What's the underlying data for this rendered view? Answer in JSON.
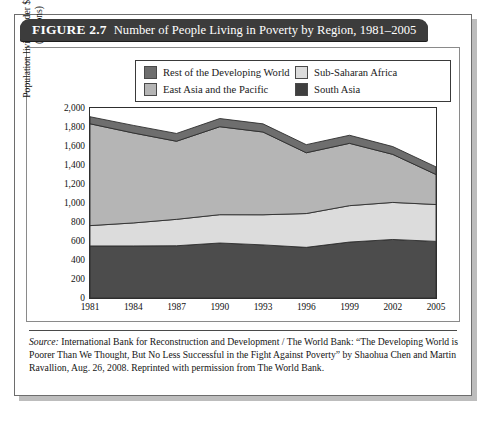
{
  "figure": {
    "number": "FIGURE 2.7",
    "title": "Number of People Living in Poverty by Region, 1981–2005"
  },
  "source": {
    "label": "Source:",
    "text": " International Bank for Reconstruction and Development / The World Bank: “The Developing World is Poorer Than We Thought, But No Less Successful in the Fight Against Poverty” by Shaohua Chen and Martin Ravallion, Aug. 26, 2008.  Reprinted with permission from The World Bank."
  },
  "chart_data": {
    "type": "area",
    "stacked": true,
    "title": "Number of People Living in Poverty by Region, 1981–2005",
    "xlabel": "",
    "ylabel": "Population living under $1.25 per day (millions)",
    "ylabel_line1": "Population living under $1.25 per day",
    "ylabel_line2": "(millions)",
    "categories": [
      "1981",
      "1984",
      "1987",
      "1990",
      "1993",
      "1996",
      "1999",
      "2002",
      "2005"
    ],
    "x": [
      1981,
      1984,
      1987,
      1990,
      1993,
      1996,
      1999,
      2002,
      2005
    ],
    "ylim": [
      0,
      2000
    ],
    "yticks": [
      "0",
      "200",
      "400",
      "600",
      "800",
      "1,000",
      "1,200",
      "1,400",
      "1,600",
      "1,800",
      "2,000"
    ],
    "ytick_values": [
      0,
      200,
      400,
      600,
      800,
      1000,
      1200,
      1400,
      1600,
      1800,
      2000
    ],
    "grid": false,
    "legend_position": "top-inside",
    "series": [
      {
        "name": "South Asia",
        "color": "#4c4c4c",
        "order": 1,
        "values": [
          548,
          548,
          550,
          579,
          559,
          533,
          589,
          616,
          596
        ]
      },
      {
        "name": "Sub-Saharan Africa",
        "color": "#dcdcdc",
        "order": 2,
        "values": [
          214,
          242,
          278,
          298,
          317,
          356,
          383,
          390,
          388
        ]
      },
      {
        "name": "East Asia and the Pacific",
        "color": "#b5b5b5",
        "order": 3,
        "values": [
          1072,
          947,
          822,
          926,
          871,
          640,
          656,
          506,
          316
        ]
      },
      {
        "name": "Rest of the Developing World",
        "color": "#6e6e6e",
        "order": 4,
        "values": [
          74,
          80,
          82,
          86,
          86,
          85,
          85,
          82,
          80
        ]
      }
    ],
    "stack_totals": [
      1908,
      1817,
      1732,
      1889,
      1833,
      1614,
      1713,
      1594,
      1380
    ]
  },
  "legend": {
    "items": [
      {
        "label": "Rest of the Developing World",
        "color": "#6e6e6e"
      },
      {
        "label": "Sub-Saharan Africa",
        "color": "#dcdcdc"
      },
      {
        "label": "East Asia and the Pacific",
        "color": "#b5b5b5"
      },
      {
        "label": "South Asia",
        "color": "#3f3f3f"
      }
    ]
  }
}
